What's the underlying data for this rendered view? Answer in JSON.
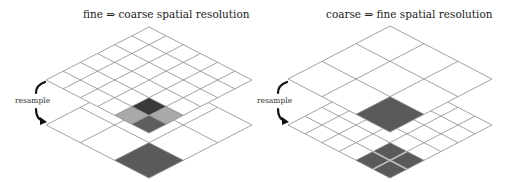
{
  "panels": [
    {
      "title": "fine ⇒ coarse spatial resolution",
      "resample_label": "resample",
      "upper_grid": {
        "rows": 6,
        "cols": 6,
        "top": [
          149,
          27
        ],
        "left": [
          46,
          80
        ],
        "right": [
          252,
          80
        ],
        "shaded": [
          {
            "i": 4,
            "j": 4,
            "color": "#3a3a3a"
          },
          {
            "i": 4,
            "j": 5,
            "color": "#a9a9a9"
          },
          {
            "i": 5,
            "j": 4,
            "color": "#a9a9a9"
          },
          {
            "i": 5,
            "j": 5,
            "color": "#5e5e5e"
          }
        ]
      },
      "lower_grid": {
        "rows": 3,
        "cols": 3,
        "top": [
          149,
          72
        ],
        "left": [
          46,
          125
        ],
        "right": [
          252,
          125
        ],
        "shaded": [
          {
            "i": 2,
            "j": 2,
            "color": "#5a5a5a"
          }
        ]
      },
      "arrow": {
        "x": 36,
        "y_start": 82,
        "y_end": 121
      }
    },
    {
      "title": "coarse ⇒ fine spatial resolution",
      "resample_label": "resample",
      "upper_grid": {
        "rows": 3,
        "cols": 3,
        "top": [
          390,
          26
        ],
        "left": [
          288,
          79
        ],
        "right": [
          492,
          79
        ],
        "shaded": [
          {
            "i": 2,
            "j": 2,
            "color": "#5a5a5a"
          }
        ]
      },
      "lower_grid": {
        "rows": 6,
        "cols": 6,
        "top": [
          390,
          72
        ],
        "left": [
          288,
          125
        ],
        "right": [
          492,
          125
        ],
        "shaded": [
          {
            "i": 4,
            "j": 4,
            "color": "#5a5a5a"
          },
          {
            "i": 4,
            "j": 5,
            "color": "#5a5a5a"
          },
          {
            "i": 5,
            "j": 4,
            "color": "#5a5a5a"
          },
          {
            "i": 5,
            "j": 5,
            "color": "#5a5a5a"
          }
        ],
        "shaded_line_color": "#bdbdbd"
      },
      "arrow": {
        "x": 278,
        "y_start": 82,
        "y_end": 121
      }
    }
  ],
  "colors": {
    "grid_line": "#8c8c8c",
    "arrow": "#111111"
  }
}
